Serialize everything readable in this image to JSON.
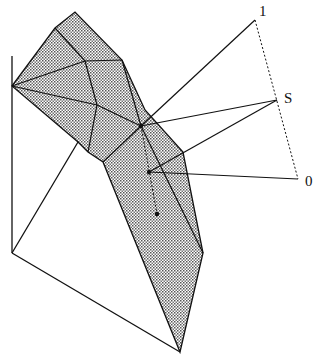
{
  "diagram": {
    "labels": {
      "one": "1",
      "s": "S",
      "zero": "0"
    },
    "colors": {
      "stroke": "#111111",
      "dot_fill": "#555555"
    }
  }
}
